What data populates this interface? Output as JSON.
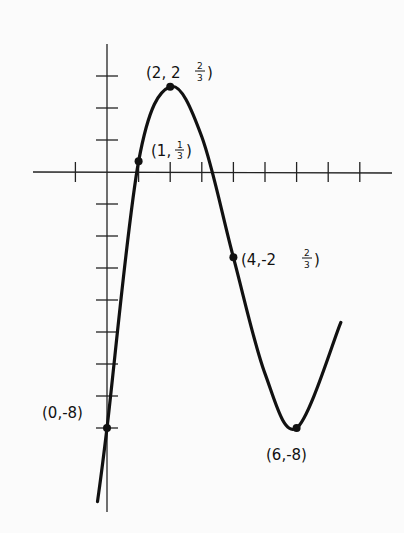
{
  "chart_data": {
    "type": "line",
    "title": "",
    "xlabel": "",
    "ylabel": "",
    "function_shape": "cubic",
    "grid": false,
    "legend": null,
    "x_ticks": [
      -1,
      1,
      2,
      3,
      4,
      5,
      6,
      7,
      8
    ],
    "y_ticks": [
      3,
      2,
      1,
      -1,
      -2,
      -3,
      -4,
      -5,
      -6,
      -7,
      -8
    ],
    "xlim": [
      -2.3,
      9
    ],
    "ylim": [
      -10.6,
      4
    ],
    "series": [
      {
        "name": "curve",
        "x": [
          -0.3,
          0,
          1,
          2,
          3,
          4,
          5,
          6,
          7.4
        ],
        "y": [
          -10.3,
          -8,
          0.333,
          2.667,
          1.1,
          -2.667,
          -6.3,
          -8,
          -4.7
        ]
      }
    ],
    "annotations": [
      {
        "x": 0,
        "y": -8,
        "label": "(0,-8)"
      },
      {
        "x": 1,
        "y": 0.333,
        "label": "(1,1/3)"
      },
      {
        "x": 2,
        "y": 2.667,
        "label": "(2, 2 2/3)"
      },
      {
        "x": 4,
        "y": -2.667,
        "label": "(4,-2 2/3)"
      },
      {
        "x": 6,
        "y": -8,
        "label": "(6,-8)"
      }
    ]
  },
  "labels": {
    "p0": "(0,-8)",
    "p1_pre": "(1,",
    "p1_num": "1",
    "p1_den": "3",
    "p1_post": ")",
    "p2_pre": "(2, 2",
    "p2_num": "2",
    "p2_den": "3",
    "p2_post": ")",
    "p4_pre": "(4,-2",
    "p4_num": "2",
    "p4_den": "3",
    "p4_post": ")",
    "p6": "(6,-8)"
  }
}
